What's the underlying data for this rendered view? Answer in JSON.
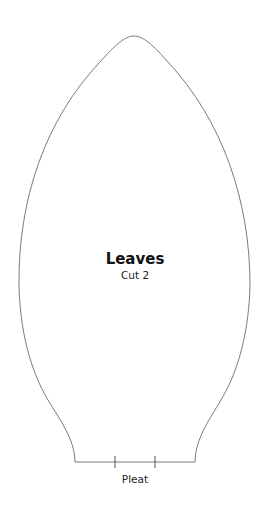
{
  "pattern": {
    "title": "Leaves",
    "instruction": "Cut 2",
    "pleat_label": "Pleat"
  },
  "colors": {
    "outline": "#7a7a7a",
    "text": "#111111",
    "background": "#ffffff"
  }
}
